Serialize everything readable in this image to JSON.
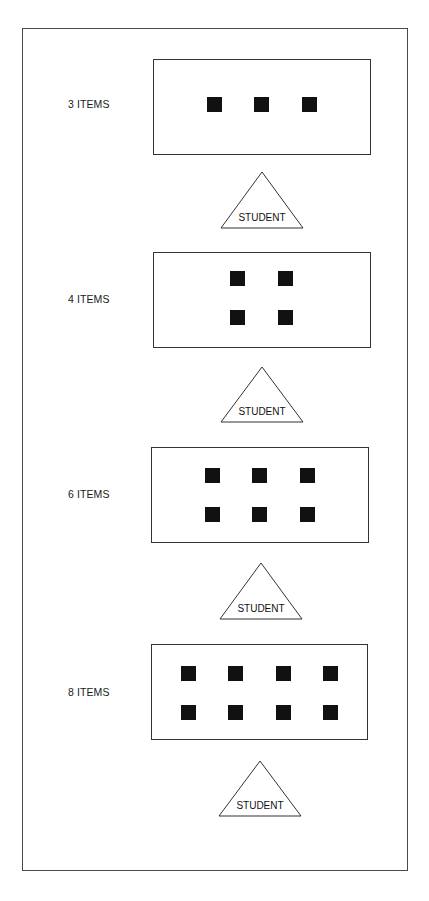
{
  "figure": {
    "student_label": "STUDENT",
    "panels": [
      {
        "label": "3 ITEMS",
        "count": 3,
        "box": {
          "x": 153,
          "y": 59,
          "w": 218,
          "h": 96
        },
        "squares": [
          [
            207,
            97
          ],
          [
            254,
            97
          ],
          [
            302,
            97
          ]
        ],
        "triangle": {
          "apex_x": 262,
          "apex_y": 172,
          "base_y": 228,
          "half_width": 41
        }
      },
      {
        "label": "4 ITEMS",
        "count": 4,
        "box": {
          "x": 153,
          "y": 252,
          "w": 218,
          "h": 96
        },
        "squares": [
          [
            230,
            271
          ],
          [
            278,
            271
          ],
          [
            230,
            310
          ],
          [
            278,
            310
          ]
        ],
        "triangle": {
          "apex_x": 262,
          "apex_y": 367,
          "base_y": 422,
          "half_width": 41
        }
      },
      {
        "label": "6 ITEMS",
        "count": 6,
        "box": {
          "x": 151,
          "y": 447,
          "w": 218,
          "h": 96
        },
        "squares": [
          [
            205,
            468
          ],
          [
            252,
            468
          ],
          [
            300,
            468
          ],
          [
            205,
            507
          ],
          [
            252,
            507
          ],
          [
            300,
            507
          ]
        ],
        "triangle": {
          "apex_x": 261,
          "apex_y": 563,
          "base_y": 619,
          "half_width": 41
        }
      },
      {
        "label": "8 ITEMS",
        "count": 8,
        "box": {
          "x": 151,
          "y": 644,
          "w": 217,
          "h": 96
        },
        "squares": [
          [
            181,
            666
          ],
          [
            228,
            666
          ],
          [
            276,
            666
          ],
          [
            323,
            666
          ],
          [
            181,
            705
          ],
          [
            228,
            705
          ],
          [
            276,
            705
          ],
          [
            323,
            705
          ]
        ],
        "triangle": {
          "apex_x": 260,
          "apex_y": 761,
          "base_y": 816,
          "half_width": 41
        }
      }
    ],
    "label_y": [
      104,
      299,
      494,
      692
    ]
  }
}
